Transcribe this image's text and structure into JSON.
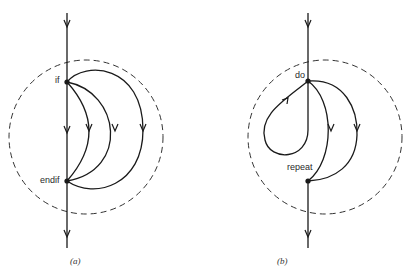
{
  "figure": {
    "panels": [
      {
        "id": "a",
        "caption": "(a)",
        "nodes": [
          {
            "label": "if"
          },
          {
            "label": "endif"
          }
        ],
        "description": "if-endif structure: main flow line with three alternative branch paths from if to endif, enclosed by dashed circle"
      },
      {
        "id": "b",
        "caption": "(b)",
        "nodes": [
          {
            "label": "do"
          },
          {
            "label": "repeat"
          }
        ],
        "description": "do-repeat loop structure: loop back-edge into do, two branches from do to repeat, enclosed by dashed circle"
      }
    ],
    "colors": {
      "stroke": "#1a1a1a",
      "dashed": "#333333",
      "background": "#ffffff"
    }
  }
}
